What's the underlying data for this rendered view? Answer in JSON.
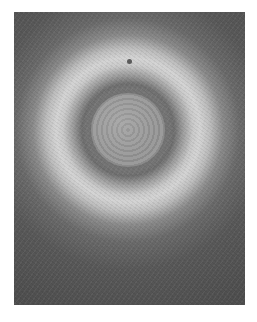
{
  "image": {
    "subject": "grayscale electron micrograph of a spherical particle with bright halo",
    "alt": "Micrograph of a round particle surrounded by a bright ring",
    "colors": {
      "background": "#ffffff",
      "outer_dark": "#4e4e4e",
      "halo": "#d4d4d4",
      "core": "#9b9b9b"
    }
  }
}
